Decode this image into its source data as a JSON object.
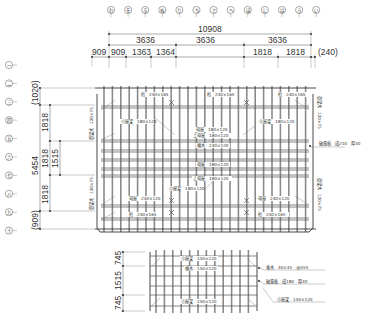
{
  "drawing": {
    "type": "roof framing plan",
    "top_grid_markers": [
      "わ",
      "を",
      "る",
      "ぬ",
      "り",
      "ち",
      "と",
      "へ",
      "ほ",
      "に",
      "は",
      "ろ",
      "い"
    ],
    "left_grid_markers": [
      "一",
      "二",
      "三",
      "四",
      "五",
      "六",
      "七",
      "八",
      "九",
      "十"
    ],
    "top_dimensions": {
      "overall": "10908",
      "row2": [
        "3636",
        "3636",
        "3636"
      ],
      "row3": [
        "909",
        "909",
        "1363",
        "1364",
        "1818",
        "1818",
        "(240)"
      ]
    },
    "left_dimensions": {
      "overall": "5454",
      "top_offset": "(1020)",
      "bottom_offset": "(909)",
      "segments": [
        "1818",
        "1818",
        "1818"
      ],
      "inner": "1515"
    },
    "section_dimensions": [
      "745",
      "1515",
      "745"
    ],
    "labels": {
      "keta_tl": "桁　240×165",
      "keta_tr": "桁　240×165",
      "keta_bl": "桁　240×165",
      "keta_br": "桁　240×165",
      "koyabari_l": "小屋梁　180×120",
      "koyabari_r": "小屋梁　180×120",
      "moya_1": "母屋　180×120",
      "agemoya_1": "上母屋　180×120",
      "munagi": "棟木　240×120",
      "moya_2": "母屋　180×120",
      "agemoya_2": "上母屋　180×120",
      "koyabari_c": "小屋梁　180×120",
      "moya_bl": "母屋　240×120",
      "moya_br": "母屋　240×120",
      "tokobari_l": "登梁木　120×75",
      "tokobari_r": "登梁木　120×75",
      "hafuita": "破風板　成210　厚30",
      "sec_koyabari_top": "小屋梁　150×120",
      "sec_munagi": "棟木　150×120",
      "sec_koyabari_bot": "小屋梁　150×120",
      "sec_taruki": "垂木　40×45　@455",
      "sec_hafuita": "破風板　成180　厚30",
      "sec_koyabari_note": "小屋梁　150×120"
    }
  }
}
